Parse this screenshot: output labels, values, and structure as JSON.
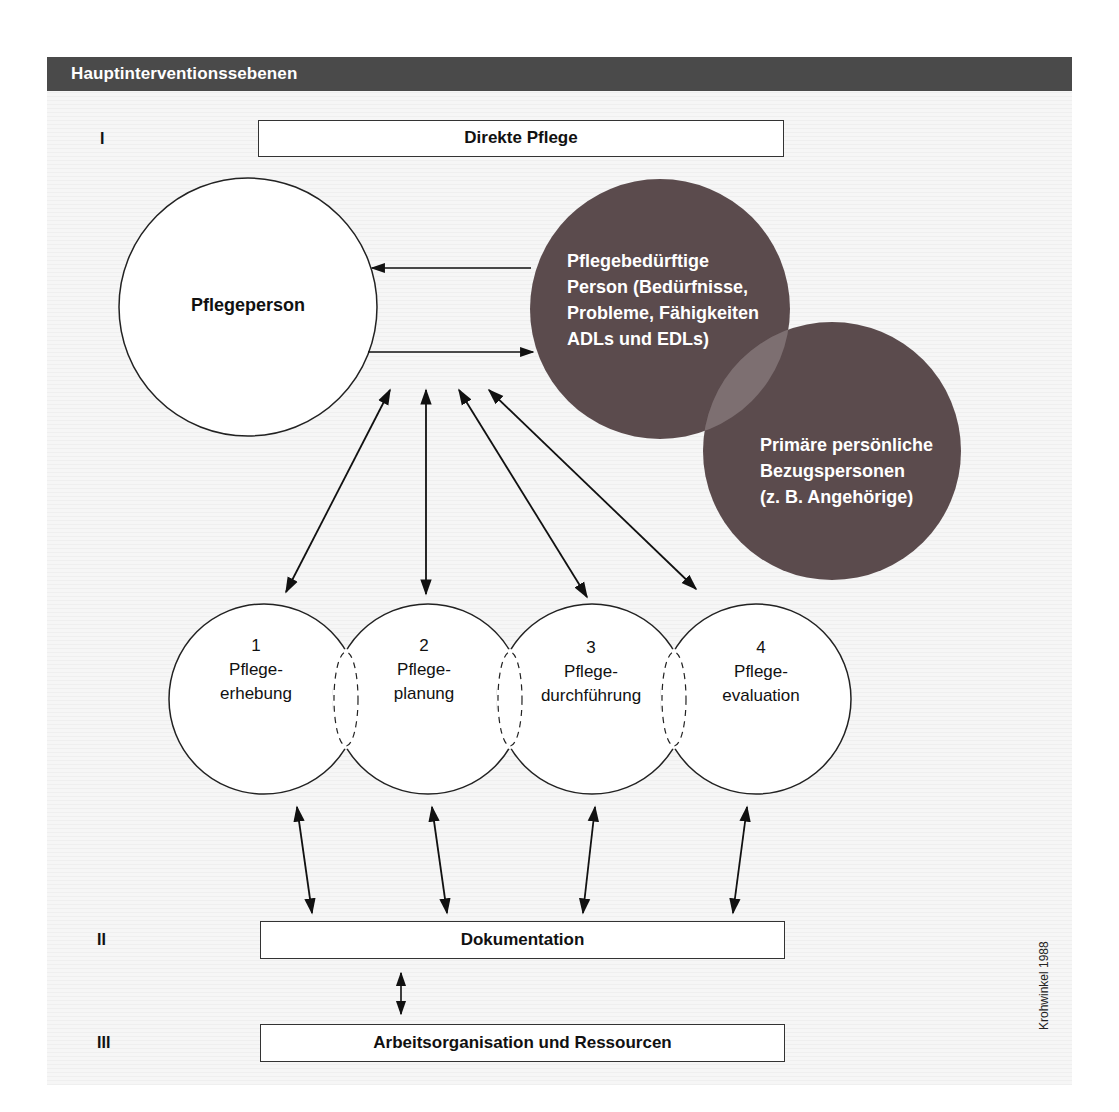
{
  "header": {
    "title": "Hauptinterventionssebenen"
  },
  "levels": [
    {
      "numeral": "I",
      "label": "Direkte Pflege"
    },
    {
      "numeral": "II",
      "label": "Dokumentation"
    },
    {
      "numeral": "III",
      "label": "Arbeitsorganisation und Ressourcen"
    }
  ],
  "actors": {
    "caregiver": "Pflegeperson",
    "patient": [
      "Pflegebedürftige",
      "Person (Bedürfnisse,",
      "Probleme, Fähigkeiten",
      "ADLs und EDLs)"
    ],
    "relatives": [
      "Primäre persönliche",
      "Bezugspersonen",
      "(z. B. Angehörige)"
    ]
  },
  "process": [
    {
      "number": "1",
      "line1": "Pflege-",
      "line2": "erhebung"
    },
    {
      "number": "2",
      "line1": "Pflege-",
      "line2": "planung"
    },
    {
      "number": "3",
      "line1": "Pflege-",
      "line2": "durchführung"
    },
    {
      "number": "4",
      "line1": "Pflege-",
      "line2": "evaluation"
    }
  ],
  "credit": "Krohwinkel 1988",
  "colors": {
    "header_bg": "#4a4a4a",
    "dark_circle": "#5b4b4d",
    "overlap": "#7d6f71",
    "line": "#111111"
  }
}
